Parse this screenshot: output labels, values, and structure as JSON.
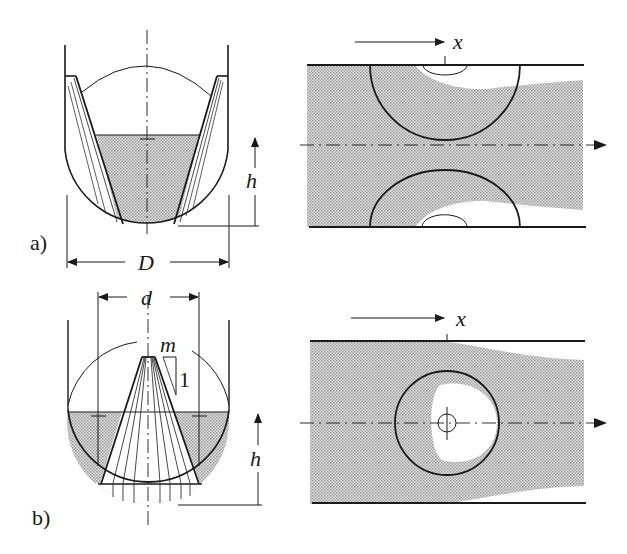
{
  "figure": {
    "colors": {
      "ink": "#1a1a1a",
      "fill_shade": "#c4c4c4",
      "background": "#ffffff"
    },
    "panel_a": {
      "label": "a)",
      "dimension_width": "D",
      "dimension_height": "h",
      "plan_axis": "x"
    },
    "panel_b": {
      "label": "b)",
      "dimension_width": "d",
      "dimension_height": "h",
      "slope_label": "m",
      "slope_unit": "1",
      "plan_axis": "x"
    }
  }
}
